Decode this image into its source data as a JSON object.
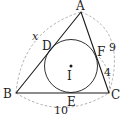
{
  "figure": {
    "type": "triangle-with-incircle",
    "colors": {
      "line": "#1a1a1a",
      "dashed": "#999999",
      "background": "#ffffff"
    },
    "points": {
      "A": {
        "label": "A"
      },
      "B": {
        "label": "B"
      },
      "C": {
        "label": "C"
      },
      "D": {
        "label": "D"
      },
      "E": {
        "label": "E"
      },
      "F": {
        "label": "F"
      },
      "I": {
        "label": "I"
      }
    },
    "lengths": {
      "AB": "x",
      "AC": "9",
      "FC": "4",
      "BC": "10"
    }
  }
}
